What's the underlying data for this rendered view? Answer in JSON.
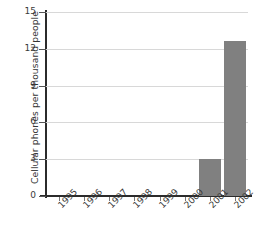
{
  "chart_data": {
    "type": "bar",
    "title": "",
    "subtitle": "",
    "xlabel": "",
    "ylabel": "Cellular phones per thousand people",
    "categories": [
      "1995",
      "1996",
      "1997",
      "1998",
      "1999",
      "2000",
      "2001",
      "2002"
    ],
    "values": [
      0,
      0,
      0,
      0,
      0,
      0,
      3,
      12.6
    ],
    "series": [
      {
        "name": "Cellular phones per thousand people",
        "values": [
          0,
          0,
          0,
          0,
          0,
          0,
          3,
          12.6
        ]
      }
    ],
    "ylim": [
      0,
      15
    ],
    "yticks": [
      0,
      3,
      6,
      9,
      12,
      15
    ],
    "ytick_labels": [
      "0",
      "3",
      "6",
      "9",
      "12",
      "15"
    ],
    "grid": true,
    "grid_axis": "y",
    "legend": false,
    "legend_position": "none",
    "bar_color": "#808080",
    "grid_color": "#d8d8d8",
    "axis_color": "#2b2b2b",
    "text_color": "#3a3a3a",
    "background_color": "#ffffff",
    "xtick_label_rotation": -45,
    "annotations": []
  }
}
